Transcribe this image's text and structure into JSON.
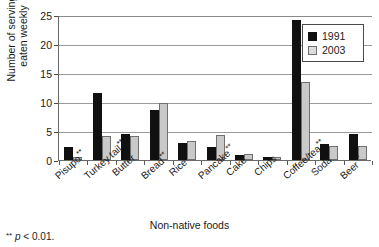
{
  "figure": {
    "top_sliver_text": "",
    "footnote": {
      "stars": "**",
      "p_symbol": "p",
      "rest": "< 0.01."
    }
  },
  "chart_data": {
    "type": "bar",
    "title": "",
    "subtitle": "",
    "xlabel": "Non-native foods",
    "ylabel": "Number of servings\neaten weekly",
    "ylim": [
      0,
      25
    ],
    "yticks": [
      0,
      5,
      10,
      15,
      20,
      25
    ],
    "ytick_labels": [
      "0",
      "5",
      "10",
      "15",
      "20",
      "25"
    ],
    "grid": "horizontal",
    "legend_position": "top-right",
    "categories": [
      "Pisupo**",
      "Turkey tail**",
      "Butter",
      "Bread**",
      "Rice",
      "Pancake**",
      "Cake",
      "Chips",
      "Coffee/tea**",
      "Soda",
      "Beer**"
    ],
    "category_base_labels": [
      "Pisupo",
      "Turkey tail",
      "Butter",
      "Bread",
      "Rice",
      "Pancake",
      "Cake",
      "Chips",
      "Coffee/tea",
      "Soda",
      "Beer"
    ],
    "category_marks": [
      "**",
      "**",
      "",
      "**",
      "",
      "**",
      "",
      "",
      "**",
      "",
      "**"
    ],
    "series": [
      {
        "name": "1991",
        "color": "#101010",
        "values": [
          2.2,
          11.6,
          4.4,
          8.7,
          3.0,
          2.2,
          0.9,
          0.6,
          24.2,
          2.7,
          4.4
        ]
      },
      {
        "name": "2003",
        "color": "#c9c9c9",
        "values": [
          0.5,
          4.2,
          4.1,
          9.9,
          3.2,
          4.3,
          1.0,
          0.6,
          13.5,
          2.4,
          2.4
        ]
      }
    ]
  }
}
